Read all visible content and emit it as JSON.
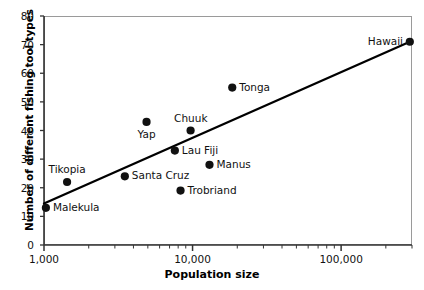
{
  "chart_data": {
    "type": "scatter",
    "title": "",
    "xlabel": "Population size",
    "ylabel": "Number of different fishing tool types",
    "xscale": "log",
    "yscale": "linear",
    "xlim": [
      1000,
      300000
    ],
    "ylim": [
      0,
      80
    ],
    "grid": false,
    "legend": null,
    "xticks": [
      {
        "value": 1000,
        "label": "1,000"
      },
      {
        "value": 10000,
        "label": "10,000"
      },
      {
        "value": 100000,
        "label": "100,000"
      }
    ],
    "yticks": [
      {
        "value": 0,
        "label": "0"
      },
      {
        "value": 10,
        "label": "10"
      },
      {
        "value": 20,
        "label": "20"
      },
      {
        "value": 30,
        "label": "30"
      },
      {
        "value": 40,
        "label": "40"
      },
      {
        "value": 50,
        "label": "50"
      },
      {
        "value": 60,
        "label": "60"
      },
      {
        "value": 70,
        "label": "70"
      },
      {
        "value": 80,
        "label": "80"
      }
    ],
    "points": [
      {
        "name": "Malekula",
        "x": 1030,
        "y": 13,
        "label_pos": "right"
      },
      {
        "name": "Tikopia",
        "x": 1430,
        "y": 22,
        "label_pos": "above"
      },
      {
        "name": "Santa Cruz",
        "x": 3500,
        "y": 24,
        "label_pos": "right"
      },
      {
        "name": "Yap",
        "x": 4900,
        "y": 43,
        "label_pos": "below"
      },
      {
        "name": "Lau Fiji",
        "x": 7600,
        "y": 33,
        "label_pos": "right"
      },
      {
        "name": "Trobriand",
        "x": 8300,
        "y": 19,
        "label_pos": "right"
      },
      {
        "name": "Chuuk",
        "x": 9700,
        "y": 40,
        "label_pos": "above"
      },
      {
        "name": "Manus",
        "x": 13000,
        "y": 28,
        "label_pos": "right"
      },
      {
        "name": "Tonga",
        "x": 18500,
        "y": 55,
        "label_pos": "right"
      },
      {
        "name": "Hawaii",
        "x": 290000,
        "y": 71,
        "label_pos": "left"
      }
    ],
    "trendline": {
      "type": "linear-fit-on-log-x",
      "start": {
        "x": 1000,
        "y": 14.5
      },
      "end": {
        "x": 290000,
        "y": 71
      },
      "color": "#000000"
    },
    "marker_color": "#111111",
    "frame_color": "#9a9a9a",
    "axis_color": "#333333"
  }
}
